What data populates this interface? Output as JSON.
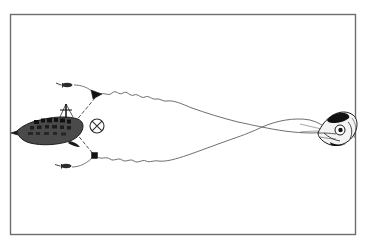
{
  "figure": {
    "kind": "technical-line-drawing",
    "subject": "midwater trawl fishing operation diagram",
    "background_color": "#ffffff",
    "ink_color": "#1a1a1a",
    "line_color": "#555555",
    "frame": {
      "label": "figure-border",
      "x": 10,
      "y": 14,
      "width": 346,
      "height": 221,
      "stroke": "#6e6e6e",
      "stroke_width": 1.4,
      "fill": "#ffffff"
    },
    "elements": [
      {
        "name": "fishing-vessel",
        "label": "Trawler hull with mast, facing right",
        "x": 16,
        "y": 113,
        "width": 68,
        "height": 40,
        "color": "#1a1a1a"
      },
      {
        "name": "reference-mark",
        "label": "Circled cross reference mark",
        "glyph": "crossed-circle",
        "cx": 97,
        "cy": 126,
        "r": 7,
        "color": "#2a2a2a"
      },
      {
        "name": "upper-otter-board",
        "label": "Upper trawl door marker",
        "cx": 97,
        "cy": 96,
        "color": "#121212"
      },
      {
        "name": "lower-otter-board",
        "label": "Lower trawl door marker",
        "cx": 95,
        "cy": 156,
        "color": "#121212"
      },
      {
        "name": "upper-float-marker",
        "label": "Upper surface float / buoy",
        "cx": 68,
        "cy": 85,
        "color": "#333333"
      },
      {
        "name": "lower-float-marker",
        "label": "Lower surface float / buoy",
        "cx": 66,
        "cy": 166,
        "color": "#333333"
      },
      {
        "name": "fish-head",
        "label": "Large fish head at net mouth, right side",
        "x": 316,
        "y": 110,
        "width": 40,
        "height": 38,
        "color": "#1a1a1a"
      },
      {
        "name": "upper-net-line",
        "label": "Upper wavy net headline sweeping right",
        "color": "#555555"
      },
      {
        "name": "lower-net-line",
        "label": "Lower wavy net footrope sweeping right",
        "color": "#555555"
      },
      {
        "name": "upper-bridle-line",
        "label": "Dashed bridle from vessel bow to upper door",
        "style": "dashed",
        "color": "#3a3a3a"
      },
      {
        "name": "lower-bridle-line",
        "label": "Dashed bridle from vessel bow to lower door",
        "style": "dashed",
        "color": "#3a3a3a"
      },
      {
        "name": "line-crossing-point",
        "label": "Point where the two net lines cross",
        "cx": 262,
        "cy": 127
      }
    ]
  }
}
